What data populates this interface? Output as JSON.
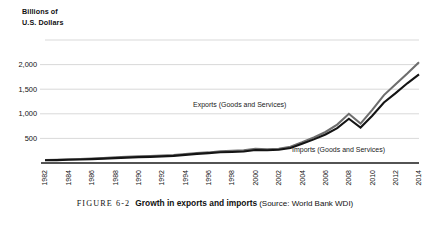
{
  "figure": {
    "label": "FIGURE 6-2",
    "title": "Growth in exports and imports",
    "source": "(Source: World Bank WDI)"
  },
  "axis_title": {
    "line1": "Billions of",
    "line2": "U.S. Dollars"
  },
  "annotations": {
    "exports": "Exports (Goods and Services)",
    "imports": "Imports (Goods and Services)"
  },
  "colors": {
    "imports_line": "#6e6e6e",
    "exports_line": "#141414",
    "gridline": "#c9c9c9",
    "axis": "#1a1a1a",
    "background": "#ffffff",
    "text": "#111111"
  },
  "chart_data": {
    "type": "line",
    "title": "Growth in exports and imports",
    "subtitle": "",
    "xlabel": "",
    "ylabel": "Billions of U.S. Dollars",
    "xlim": [
      1982,
      2014
    ],
    "ylim": [
      0,
      2500
    ],
    "yticks": [
      500,
      1000,
      1500,
      2000
    ],
    "ytick_labels": [
      "500",
      "1,000",
      "1,500",
      "2,000"
    ],
    "gridlines_y": [
      0,
      500,
      1000,
      1500,
      2000,
      2500
    ],
    "grid": true,
    "legend": "inline-annotations",
    "x": [
      1982,
      1983,
      1984,
      1985,
      1986,
      1987,
      1988,
      1989,
      1990,
      1991,
      1992,
      1993,
      1994,
      1995,
      1996,
      1997,
      1998,
      1999,
      2000,
      2001,
      2002,
      2003,
      2004,
      2005,
      2006,
      2007,
      2008,
      2009,
      2010,
      2011,
      2012,
      2013,
      2014
    ],
    "xticks": [
      1982,
      1984,
      1986,
      1988,
      1990,
      1992,
      1994,
      1996,
      1998,
      2000,
      2002,
      2004,
      2006,
      2008,
      2010,
      2012,
      2014
    ],
    "xtick_labels": [
      "1982",
      "1984",
      "1986",
      "1988",
      "1990",
      "1992",
      "1994",
      "1996",
      "1998",
      "2000",
      "2002",
      "2004",
      "2006",
      "2008",
      "2010",
      "2012",
      "2014"
    ],
    "series": [
      {
        "name": "Imports (Goods and Services)",
        "color": "#6e6e6e",
        "values": [
          60,
          65,
          75,
          80,
          90,
          100,
          115,
          125,
          135,
          140,
          150,
          160,
          180,
          200,
          215,
          240,
          250,
          260,
          290,
          280,
          290,
          330,
          420,
          520,
          630,
          780,
          1000,
          800,
          1080,
          1380,
          1600,
          1820,
          2050
        ]
      },
      {
        "name": "Exports (Goods and Services)",
        "color": "#141414",
        "values": [
          55,
          58,
          65,
          70,
          78,
          88,
          100,
          110,
          120,
          125,
          135,
          145,
          165,
          185,
          200,
          220,
          225,
          235,
          265,
          260,
          270,
          305,
          390,
          480,
          580,
          710,
          900,
          720,
          960,
          1230,
          1420,
          1620,
          1800
        ]
      }
    ]
  }
}
